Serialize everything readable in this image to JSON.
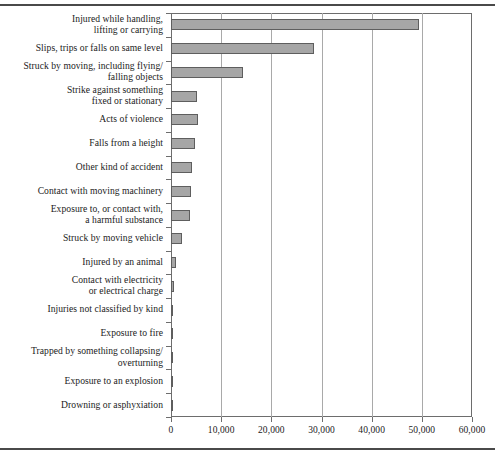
{
  "figure": {
    "rule_top": "horizontal-rule",
    "rule_bottom": "horizontal-rule"
  },
  "chart_data": {
    "type": "bar",
    "orientation": "horizontal",
    "title": "",
    "xlabel": "",
    "ylabel": "",
    "xlim": [
      0,
      60000
    ],
    "xticks": [
      0,
      10000,
      20000,
      30000,
      40000,
      50000,
      60000
    ],
    "xticklabels": [
      "0",
      "10,000",
      "20,000",
      "30,000",
      "40,000",
      "50,000",
      "60,000"
    ],
    "grid": "vertical",
    "legend": "none",
    "bar_color": "#a6a6a6",
    "bar_edge_color": "#5e5e5e",
    "categories": [
      "Injured while handling,\nlifting or carrying",
      "Slips, trips or falls on same level",
      "Struck by moving, including flying/\nfalling objects",
      "Strike against something\nfixed or stationary",
      "Acts of violence",
      "Falls from a height",
      "Other kind of accident",
      "Contact with moving machinery",
      "Exposure to, or contact with,\na harmful substance",
      "Struck by moving vehicle",
      "Injured by an animal",
      "Contact with electricity\nor electrical charge",
      "Injuries not classified by kind",
      "Exposure to fire",
      "Trapped by something collapsing/\noverturning",
      "Exposure to an explosion",
      "Drowning or asphyxiation"
    ],
    "values": [
      49500,
      28600,
      14300,
      5200,
      5300,
      4800,
      4200,
      3900,
      3800,
      2200,
      900,
      500,
      450,
      400,
      350,
      300,
      60
    ]
  }
}
